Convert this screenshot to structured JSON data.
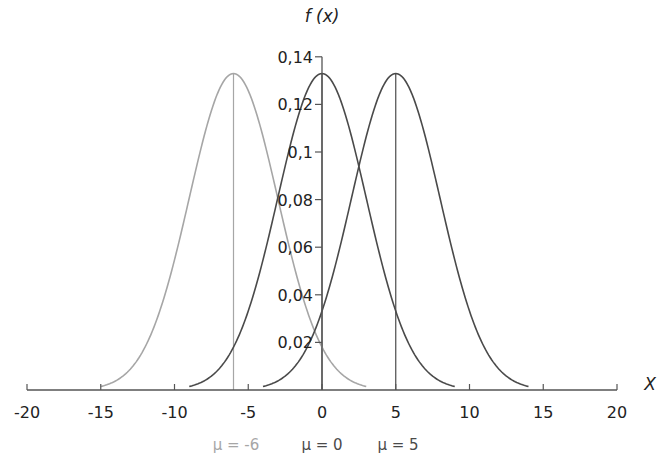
{
  "chart_data": {
    "type": "line",
    "title": "",
    "ylabel": "f (x)",
    "xlabel": "X",
    "xlim": [
      -20,
      20
    ],
    "ylim": [
      0,
      0.14
    ],
    "xticks": [
      -20,
      -15,
      -10,
      -5,
      0,
      5,
      10,
      15,
      20
    ],
    "xtick_labels": [
      "-20",
      "-15",
      "-10",
      "-5",
      "0",
      "5",
      "10",
      "15",
      "20"
    ],
    "yticks": [
      0.02,
      0.04,
      0.06,
      0.08,
      0.1,
      0.12,
      0.14
    ],
    "ytick_labels": [
      "0,02",
      "0,04",
      "0,06",
      "0,08",
      "0,1",
      "0,12",
      "0,14"
    ],
    "grid": false,
    "legend_position": "bottom",
    "series": [
      {
        "name": "μ = -6",
        "mu": -6,
        "sigma": 3,
        "x_range": [
          -15,
          3
        ],
        "peak": 0.133,
        "color": "#a6a6a6"
      },
      {
        "name": "μ = 0",
        "mu": 0,
        "sigma": 3,
        "x_range": [
          -9,
          9
        ],
        "peak": 0.133,
        "color": "#4a4a4a"
      },
      {
        "name": "μ = 5",
        "mu": 5,
        "sigma": 3,
        "x_range": [
          -4,
          14
        ],
        "peak": 0.133,
        "color": "#4a4a4a"
      }
    ],
    "mean_lines": [
      -6,
      0,
      5
    ]
  },
  "labels": {
    "y_axis_title": "f (x)",
    "x_axis_title": "X",
    "legend": [
      "μ = -6",
      "μ = 0",
      "μ = 5"
    ]
  }
}
